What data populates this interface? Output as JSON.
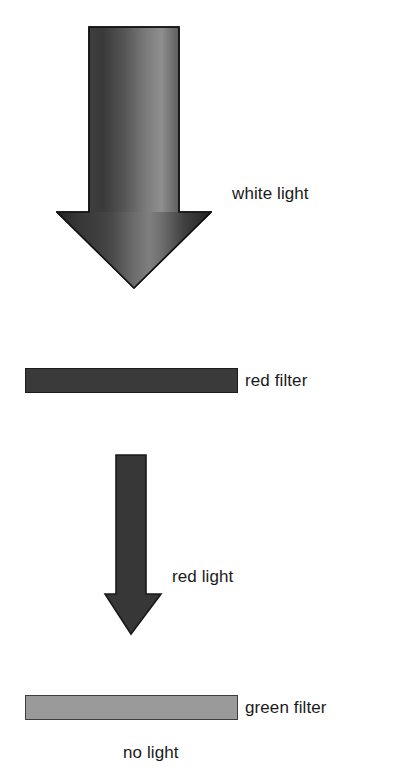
{
  "diagram": {
    "background_color": "#ffffff",
    "text_color": "#1a1a1a"
  },
  "elements": {
    "white_light_arrow": {
      "label": "white light",
      "icon": "down-arrow-icon",
      "description": "large downward arrow with vertical light-to-dark gradient",
      "gradient_stops": [
        "#1e1e1e",
        "#3a3a3a",
        "#6e6e6e",
        "#8d8d8d",
        "#4a4a4a",
        "#2a2a2a"
      ],
      "outline_color": "#111111"
    },
    "red_filter": {
      "label": "red filter",
      "bar_color": "#3a3a3a",
      "border_color": "#1c1c1c"
    },
    "red_light_arrow": {
      "label": "red light",
      "icon": "down-arrow-icon",
      "description": "narrow solid downward arrow",
      "fill_color": "#373737",
      "outline_color": "#1a1a1a"
    },
    "green_filter": {
      "label": "green filter",
      "bar_color": "#9a9a9a",
      "border_color": "#3d3d3d"
    },
    "no_light": {
      "label": "no light"
    }
  }
}
